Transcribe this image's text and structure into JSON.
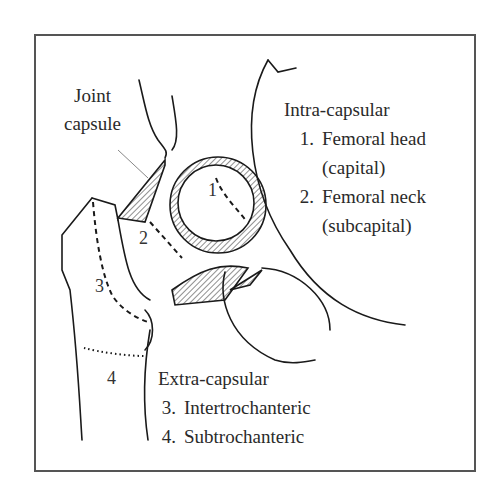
{
  "figure": {
    "joint_label": [
      "Joint",
      "capsule"
    ],
    "intra": {
      "heading": "Intra-capsular",
      "items": [
        {
          "num": "1.",
          "name": "Femoral head",
          "sub": "(capital)"
        },
        {
          "num": "2.",
          "name": "Femoral neck",
          "sub": "(subcapital)"
        }
      ]
    },
    "extra": {
      "heading": "Extra-capsular",
      "items": [
        {
          "num": "3.",
          "name": "Intertrochanteric"
        },
        {
          "num": "4.",
          "name": "Subtrochanteric"
        }
      ]
    },
    "region_markers": [
      "1",
      "2",
      "3",
      "4"
    ],
    "colors": {
      "line": "#1a1a1a",
      "frame": "#555555",
      "leader": "#888888"
    }
  }
}
